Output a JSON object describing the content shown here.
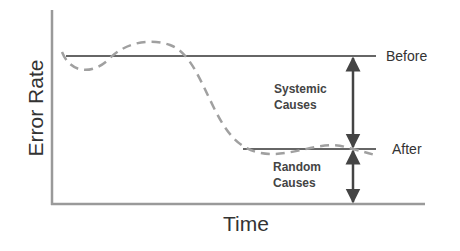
{
  "diagram": {
    "axes": {
      "y_label": "Error Rate",
      "x_label": "Time"
    },
    "levels": [
      {
        "name": "before",
        "label": "Before"
      },
      {
        "name": "after",
        "label": "After"
      }
    ],
    "regions": {
      "systemic": {
        "line1": "Systemic",
        "line2": "Causes"
      },
      "random": {
        "line1": "Random",
        "line2": "Causes"
      }
    },
    "colors": {
      "axis": "#9a9a9a",
      "level_line": "#333333",
      "dashed_curve": "#a0a0a0",
      "arrow": "#444444"
    }
  }
}
